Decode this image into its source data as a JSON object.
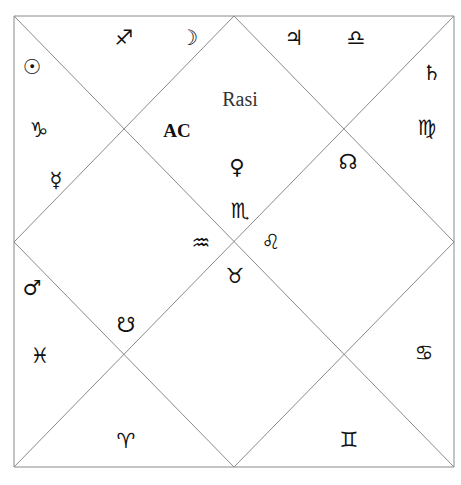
{
  "chart": {
    "title": "Rasi",
    "ascendant_label": "AC",
    "line_color": "#8a8a8a",
    "frame": {
      "left": 14,
      "top": 16,
      "right": 454,
      "bottom": 467
    }
  },
  "glyphs": [
    {
      "name": "sagittarius-icon",
      "symbol": "♐",
      "kind": "sign",
      "x": 124,
      "y": 38
    },
    {
      "name": "moon-icon",
      "symbol": "☽",
      "kind": "planet",
      "x": 189,
      "y": 38
    },
    {
      "name": "jupiter-icon",
      "symbol": "♃",
      "kind": "planet",
      "x": 294,
      "y": 38
    },
    {
      "name": "libra-icon",
      "symbol": "♎",
      "kind": "sign",
      "x": 356,
      "y": 38
    },
    {
      "name": "sun-icon",
      "symbol": "☉",
      "kind": "planet",
      "x": 32,
      "y": 67
    },
    {
      "name": "saturn-icon",
      "symbol": "♄",
      "kind": "planet",
      "x": 432,
      "y": 73
    },
    {
      "name": "capricorn-icon",
      "symbol": "♑",
      "kind": "sign",
      "x": 39,
      "y": 130
    },
    {
      "name": "virgo-icon",
      "symbol": "♍",
      "kind": "sign",
      "x": 427,
      "y": 128
    },
    {
      "name": "mercury-icon",
      "symbol": "☿",
      "kind": "planet",
      "x": 56,
      "y": 180
    },
    {
      "name": "venus-icon",
      "symbol": "♀",
      "kind": "planet",
      "x": 237,
      "y": 167
    },
    {
      "name": "north-node-icon",
      "symbol": "☊",
      "kind": "planet",
      "x": 348,
      "y": 162
    },
    {
      "name": "scorpio-icon",
      "symbol": "♏",
      "kind": "sign",
      "x": 240,
      "y": 211
    },
    {
      "name": "aquarius-icon",
      "symbol": "♒",
      "kind": "sign",
      "x": 201,
      "y": 243
    },
    {
      "name": "leo-icon",
      "symbol": "♌",
      "kind": "sign",
      "x": 271,
      "y": 242
    },
    {
      "name": "taurus-icon",
      "symbol": "♉",
      "kind": "sign",
      "x": 235,
      "y": 276
    },
    {
      "name": "mars-icon",
      "symbol": "♂",
      "kind": "planet",
      "x": 32,
      "y": 288
    },
    {
      "name": "south-node-icon",
      "symbol": "☋",
      "kind": "planet",
      "x": 126,
      "y": 325
    },
    {
      "name": "pisces-icon",
      "symbol": "♓",
      "kind": "sign",
      "x": 40,
      "y": 356
    },
    {
      "name": "cancer-icon",
      "symbol": "♋",
      "kind": "sign",
      "x": 424,
      "y": 353
    },
    {
      "name": "aries-icon",
      "symbol": "♈",
      "kind": "sign",
      "x": 126,
      "y": 441
    },
    {
      "name": "gemini-icon",
      "symbol": "♊",
      "kind": "sign",
      "x": 349,
      "y": 440
    }
  ],
  "labels": {
    "rasi": {
      "text": "Rasi",
      "x": 240,
      "y": 99
    },
    "ac": {
      "text": "AC",
      "x": 177,
      "y": 130
    }
  }
}
